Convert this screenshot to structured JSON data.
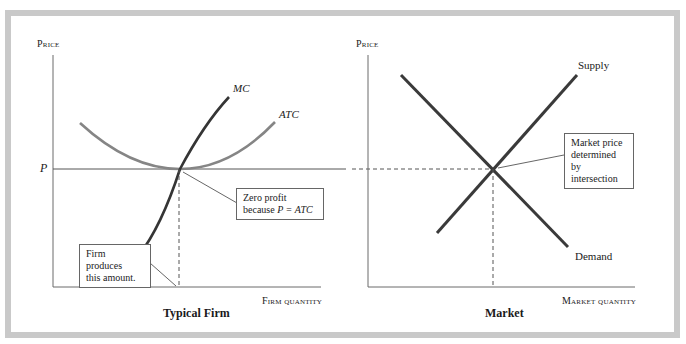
{
  "colors": {
    "frame": "#c9c9c9",
    "mc_curve": "#333333",
    "atc_curve": "#808080",
    "supply_demand": "#3a3a3a",
    "axis": "#555555"
  },
  "left_panel": {
    "title": "Typical Firm",
    "y_axis_label": "Price",
    "x_axis_label": "Firm quantity",
    "price_label": "P",
    "mc_label": "MC",
    "atc_label": "ATC",
    "annotation_zero_profit": {
      "line1": "Zero profit",
      "line2_prefix": "because ",
      "line2_italic": "P = ATC"
    },
    "annotation_firm_produces": {
      "line1": "Firm produces",
      "line2": "this amount."
    }
  },
  "right_panel": {
    "title": "Market",
    "y_axis_label": "Price",
    "x_axis_label": "Market quantity",
    "supply_label": "Supply",
    "demand_label": "Demand",
    "annotation_market_price": {
      "line1": "Market price",
      "line2": "determined by",
      "line3": "intersection"
    }
  }
}
